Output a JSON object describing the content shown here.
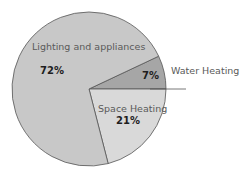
{
  "chart_data": {
    "type": "pie",
    "title": "",
    "categories": [
      "Water Heating",
      "Space Heating",
      "Lighting and appliances"
    ],
    "values": [
      7,
      21,
      72
    ],
    "labels": [
      "7%",
      "21%",
      "72%"
    ],
    "colors": [
      "#a6a6a6",
      "#d9d9d9",
      "#c8c8c8"
    ],
    "start_angle_deg": 0,
    "legend": "none",
    "data_labels": "inside with category name"
  },
  "slices": [
    {
      "name": "Water Heating",
      "value": 7,
      "pct_label": "7%",
      "color": "#a6a6a6"
    },
    {
      "name": "Space Heating",
      "value": 21,
      "pct_label": "21%",
      "color": "#d9d9d9"
    },
    {
      "name": "Lighting and appliances",
      "value": 72,
      "pct_label": "72%",
      "color": "#c8c8c8"
    }
  ],
  "style": {
    "stroke": "#555555",
    "leader_line": "#555555"
  }
}
